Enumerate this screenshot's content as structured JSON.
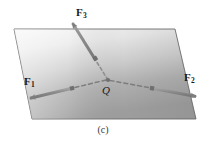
{
  "figure": {
    "caption": "(c)",
    "point_label": "Q",
    "vectors": [
      {
        "name": "F1",
        "base": "F",
        "subscript": "1"
      },
      {
        "name": "F2",
        "base": "F",
        "subscript": "2"
      },
      {
        "name": "F3",
        "base": "F",
        "subscript": "3"
      }
    ],
    "colors": {
      "plane_light": "#f2f2f2",
      "plane_dark": "#a5a5a5",
      "plane_edge": "#6e6e6e",
      "vector": "#8c8c8c",
      "vector_dark": "#707070",
      "text": "#1a1a1a",
      "background": "#ffffff"
    },
    "geometry": {
      "plane_points": "14,29 175,29 196,119 32,119",
      "origin": {
        "x": 108,
        "y": 80
      },
      "f1_tip": {
        "x": 26,
        "y": 99
      },
      "f2_tip": {
        "x": 199,
        "y": 96
      },
      "f3_tip": {
        "x": 70,
        "y": 20
      }
    }
  }
}
